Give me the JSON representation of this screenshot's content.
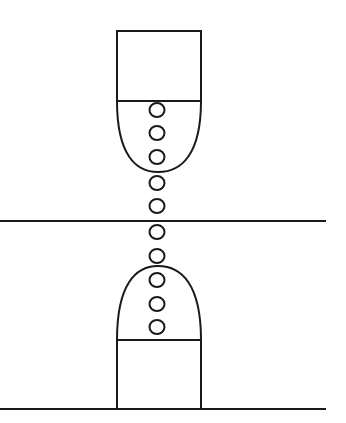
{
  "diagram": {
    "background": "#ffffff",
    "stroke_color": "#1a1a1a",
    "stroke_width": 2,
    "horizontal_lines": [
      {
        "name": "middle-plane-line",
        "x1": 0,
        "y1": 221,
        "x2": 326,
        "y2": 221
      },
      {
        "name": "bottom-base-line",
        "x1": 0,
        "y1": 409,
        "x2": 326,
        "y2": 409
      }
    ],
    "top_electrode": {
      "box": {
        "x": 117,
        "y": 31,
        "width": 84,
        "height": 70
      },
      "tip": {
        "left_x": 117,
        "right_x": 201,
        "base_y": 101,
        "apex_x": 158,
        "apex_y": 172
      }
    },
    "bottom_electrode": {
      "box": {
        "x": 117,
        "y": 340,
        "width": 84,
        "height": 69
      },
      "tip": {
        "left_x": 117,
        "right_x": 201,
        "base_y": 340,
        "apex_x": 158,
        "apex_y": 266
      }
    },
    "particles": {
      "center_x": 157,
      "rx": 7.5,
      "ry": 7,
      "centers_y": [
        110,
        133,
        157,
        183,
        206,
        232,
        256,
        280,
        304,
        327
      ]
    }
  }
}
